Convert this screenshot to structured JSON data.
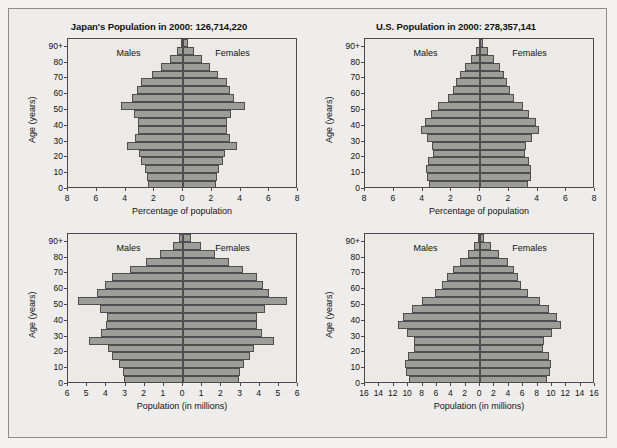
{
  "figure": {
    "background_color": "#eeedeb",
    "bar_fill_color": "#9d9d9a",
    "bar_stroke_color": "#4e4e4e",
    "axis_color": "#4a4a4a"
  },
  "common": {
    "males_label": "Males",
    "females_label": "Females",
    "y_axis_title": "Age (years)",
    "age_tick_labels": [
      "0",
      "10",
      "20",
      "30",
      "40",
      "50",
      "60",
      "70",
      "80",
      "90+"
    ],
    "age_tick_values": [
      0,
      10,
      20,
      30,
      40,
      50,
      60,
      70,
      80,
      90
    ],
    "age_groups": [
      "0-4",
      "5-9",
      "10-14",
      "15-19",
      "20-24",
      "25-29",
      "30-34",
      "35-39",
      "40-44",
      "45-49",
      "50-54",
      "55-59",
      "60-64",
      "65-69",
      "70-74",
      "75-79",
      "80-84",
      "85-89",
      "90+"
    ]
  },
  "chart_data": [
    {
      "id": "japan-percent",
      "type": "bar",
      "orientation": "population-pyramid",
      "title": "Japan's Population in 2000: 126,714,220",
      "country": "Japan",
      "year": "2000",
      "total_population": "126,714,220",
      "xlabel": "Percentage of population",
      "ylabel": "Age (years)",
      "x_tick_labels": [
        "8",
        "6",
        "4",
        "2",
        "0",
        "2",
        "4",
        "6",
        "8"
      ],
      "x_tick_values": [
        -8,
        -6,
        -4,
        -2,
        0,
        2,
        4,
        6,
        8
      ],
      "xlim": [
        -8,
        8
      ],
      "grid": false,
      "legend": [
        "Males",
        "Females"
      ],
      "legend_position": "inside-top",
      "categories": [
        "0-4",
        "5-9",
        "10-14",
        "15-19",
        "20-24",
        "25-29",
        "30-34",
        "35-39",
        "40-44",
        "45-49",
        "50-54",
        "55-59",
        "60-64",
        "65-69",
        "70-74",
        "75-79",
        "80-84",
        "85-89",
        "90+"
      ],
      "series": [
        {
          "name": "Males",
          "side": "left",
          "values": [
            2.42,
            2.47,
            2.62,
            2.92,
            3.07,
            3.89,
            3.37,
            3.16,
            3.12,
            3.42,
            4.32,
            3.54,
            3.23,
            2.92,
            2.19,
            1.52,
            0.93,
            0.43,
            0.15
          ]
        },
        {
          "name": "Females",
          "side": "right",
          "values": [
            2.3,
            2.35,
            2.49,
            2.78,
            2.94,
            3.73,
            3.26,
            3.06,
            3.04,
            3.36,
            4.28,
            3.54,
            3.28,
            3.06,
            2.46,
            1.9,
            1.33,
            0.76,
            0.32
          ]
        }
      ]
    },
    {
      "id": "us-percent",
      "type": "bar",
      "orientation": "population-pyramid",
      "title": "U.S. Population in 2000: 278,357,141",
      "country": "United States",
      "year": "2000",
      "total_population": "278,357,141",
      "xlabel": "Percentage of population",
      "ylabel": "Age (years)",
      "x_tick_labels": [
        "8",
        "6",
        "4",
        "2",
        "0",
        "2",
        "4",
        "6",
        "8"
      ],
      "x_tick_values": [
        -8,
        -6,
        -4,
        -2,
        0,
        2,
        4,
        6,
        8
      ],
      "xlim": [
        -8,
        8
      ],
      "grid": false,
      "legend": [
        "Males",
        "Females"
      ],
      "legend_position": "inside-top",
      "categories": [
        "0-4",
        "5-9",
        "10-14",
        "15-19",
        "20-24",
        "25-29",
        "30-34",
        "35-39",
        "40-44",
        "45-49",
        "50-54",
        "55-59",
        "60-64",
        "65-69",
        "70-74",
        "75-79",
        "80-84",
        "85-89",
        "90+"
      ],
      "series": [
        {
          "name": "Males",
          "side": "left",
          "values": [
            3.52,
            3.7,
            3.73,
            3.6,
            3.28,
            3.31,
            3.67,
            4.1,
            3.86,
            3.4,
            2.9,
            2.26,
            1.88,
            1.66,
            1.37,
            1.01,
            0.61,
            0.28,
            0.1
          ]
        },
        {
          "name": "Females",
          "side": "right",
          "values": [
            3.36,
            3.52,
            3.55,
            3.43,
            3.15,
            3.21,
            3.6,
            4.07,
            3.87,
            3.44,
            2.99,
            2.39,
            2.06,
            1.91,
            1.7,
            1.39,
            0.97,
            0.53,
            0.22
          ]
        }
      ]
    },
    {
      "id": "japan-millions",
      "type": "bar",
      "orientation": "population-pyramid",
      "title": "",
      "country": "Japan",
      "year": "2000",
      "xlabel": "Population (in millions)",
      "ylabel": "Age (years)",
      "x_tick_labels": [
        "6",
        "5",
        "4",
        "3",
        "2",
        "1",
        "0",
        "1",
        "2",
        "3",
        "4",
        "5",
        "6"
      ],
      "x_tick_values": [
        -6,
        -5,
        -4,
        -3,
        -2,
        -1,
        0,
        1,
        2,
        3,
        4,
        5,
        6
      ],
      "xlim": [
        -6,
        6
      ],
      "grid": false,
      "legend": [
        "Males",
        "Females"
      ],
      "legend_position": "inside-top",
      "unit": "millions",
      "categories": [
        "0-4",
        "5-9",
        "10-14",
        "15-19",
        "20-24",
        "25-29",
        "30-34",
        "35-39",
        "40-44",
        "45-49",
        "50-54",
        "55-59",
        "60-64",
        "65-69",
        "70-74",
        "75-79",
        "80-84",
        "85-89",
        "90+"
      ],
      "series": [
        {
          "name": "Males",
          "side": "left",
          "values": [
            3.07,
            3.13,
            3.32,
            3.7,
            3.89,
            4.93,
            4.27,
            4.01,
            3.95,
            4.33,
            5.47,
            4.49,
            4.09,
            3.7,
            2.78,
            1.93,
            1.18,
            0.54,
            0.19
          ]
        },
        {
          "name": "Females",
          "side": "right",
          "values": [
            2.92,
            2.98,
            3.16,
            3.52,
            3.72,
            4.73,
            4.13,
            3.88,
            3.85,
            4.26,
            5.42,
            4.49,
            4.16,
            3.88,
            3.12,
            2.41,
            1.69,
            0.96,
            0.41
          ]
        }
      ]
    },
    {
      "id": "us-millions",
      "type": "bar",
      "orientation": "population-pyramid",
      "title": "",
      "country": "United States",
      "year": "2000",
      "xlabel": "Population (in millions)",
      "ylabel": "Age (years)",
      "x_tick_labels": [
        "16",
        "14",
        "12",
        "10",
        "8",
        "6",
        "4",
        "2",
        "0",
        "2",
        "4",
        "6",
        "8",
        "10",
        "12",
        "14",
        "16"
      ],
      "x_tick_values": [
        -16,
        -14,
        -12,
        -10,
        -8,
        -6,
        -4,
        -2,
        0,
        2,
        4,
        6,
        8,
        10,
        12,
        14,
        16
      ],
      "xlim": [
        -16,
        16
      ],
      "grid": false,
      "legend": [
        "Males",
        "Females"
      ],
      "legend_position": "inside-top",
      "unit": "millions",
      "categories": [
        "0-4",
        "5-9",
        "10-14",
        "15-19",
        "20-24",
        "25-29",
        "30-34",
        "35-39",
        "40-44",
        "45-49",
        "50-54",
        "55-59",
        "60-64",
        "65-69",
        "70-74",
        "75-79",
        "80-84",
        "85-89",
        "90+"
      ],
      "series": [
        {
          "name": "Males",
          "side": "left",
          "values": [
            9.81,
            10.3,
            10.39,
            10.02,
            9.14,
            9.21,
            10.21,
            11.4,
            10.75,
            9.47,
            8.08,
            6.28,
            5.23,
            4.61,
            3.82,
            2.81,
            1.71,
            0.79,
            0.28
          ]
        },
        {
          "name": "Females",
          "side": "right",
          "values": [
            9.36,
            9.8,
            9.89,
            9.54,
            8.76,
            8.94,
            10.02,
            11.32,
            10.77,
            9.58,
            8.32,
            6.66,
            5.74,
            5.31,
            4.74,
            3.86,
            2.71,
            1.48,
            0.61
          ]
        }
      ]
    }
  ]
}
